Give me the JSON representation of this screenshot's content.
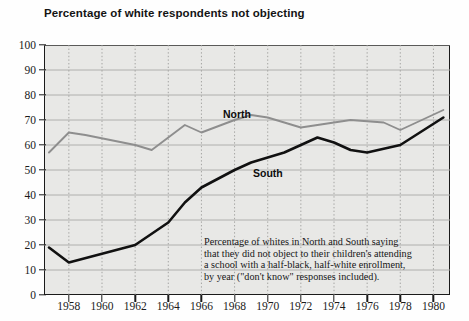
{
  "chart_data": {
    "type": "line",
    "title": "Percentage of white respondents not objecting",
    "xlabel": "",
    "ylabel": "",
    "xlim": [
      1956.5,
      1981.0
    ],
    "ylim": [
      0,
      100
    ],
    "grid": true,
    "legend_position": "inline-labels",
    "y_ticks": [
      0,
      10,
      20,
      30,
      40,
      50,
      60,
      70,
      80,
      90,
      100
    ],
    "x_ticks": [
      1958,
      1960,
      1962,
      1964,
      1966,
      1968,
      1970,
      1972,
      1974,
      1976,
      1978,
      1980
    ],
    "series": [
      {
        "name": "North",
        "color": "#8e8e8e",
        "x": [
          1956.8,
          1958,
          1959,
          1962,
          1963,
          1965,
          1966,
          1968,
          1969,
          1970,
          1972,
          1973,
          1975,
          1977,
          1978,
          1980.6
        ],
        "values": [
          57,
          65,
          64,
          60,
          58,
          68,
          65,
          70,
          72,
          71,
          67,
          68,
          70,
          69,
          66,
          74
        ]
      },
      {
        "name": "South",
        "color": "#111111",
        "x": [
          1956.8,
          1958,
          1962,
          1964,
          1965,
          1966,
          1968,
          1969,
          1971,
          1972,
          1973,
          1974,
          1975,
          1976,
          1978,
          1980.6
        ],
        "values": [
          19,
          13,
          20,
          29,
          37,
          43,
          50,
          53,
          57,
          60,
          63,
          61,
          58,
          57,
          60,
          71
        ]
      }
    ],
    "annotations": [
      {
        "name": "North",
        "text": "North",
        "x": 1968,
        "y": 78
      },
      {
        "name": "South",
        "text": "South",
        "x": 1970,
        "y": 53
      }
    ],
    "caption_lines": [
      "Percentage of whites in North and South saying",
      "that they did not object to their children's attending",
      "a school with a half-black, half-white enrollment,",
      "by year (\"don't know\" responses included)."
    ]
  }
}
